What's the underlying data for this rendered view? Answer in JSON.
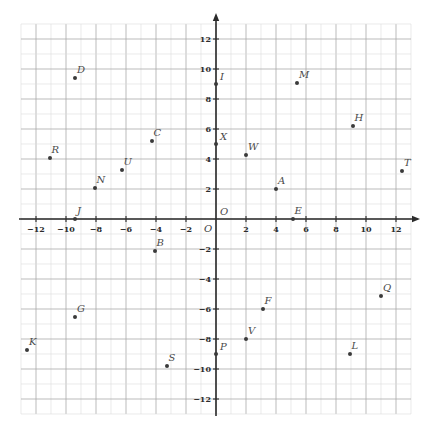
{
  "chart_data": {
    "type": "scatter",
    "title": "",
    "xlabel": "",
    "ylabel": "",
    "xlim": [
      -13,
      13
    ],
    "ylim": [
      -13,
      13
    ],
    "grid": true,
    "minor_grid_step": 1,
    "major_grid_step": 2,
    "legend": "none",
    "axis_origin_label": "O",
    "xticks": [
      -12,
      -10,
      -8,
      -6,
      -4,
      -2,
      2,
      4,
      6,
      8,
      10,
      12
    ],
    "xtick_labels": [
      "−12",
      "−10",
      "−8",
      "−6",
      "−4",
      "−2",
      "2",
      "4",
      "6",
      "8",
      "10",
      "12"
    ],
    "yticks": [
      12,
      10,
      8,
      6,
      4,
      2,
      -2,
      -4,
      -6,
      -8,
      -10,
      -12
    ],
    "ytick_labels": [
      "12",
      "10",
      "8",
      "6",
      "4",
      "2",
      "−2",
      "−4",
      "−6",
      "−8",
      "−10",
      "−12"
    ],
    "origin_tick_label": "O",
    "points": [
      {
        "label": "D",
        "x": -9.4,
        "y": 9.4
      },
      {
        "label": "I",
        "x": 0,
        "y": 9
      },
      {
        "label": "M",
        "x": 5.4,
        "y": 9.1
      },
      {
        "label": "H",
        "x": 9.1,
        "y": 6.2
      },
      {
        "label": "C",
        "x": -4.3,
        "y": 5.2
      },
      {
        "label": "X",
        "x": 0,
        "y": 5
      },
      {
        "label": "W",
        "x": 2,
        "y": 4.3
      },
      {
        "label": "R",
        "x": -11.1,
        "y": 4.1
      },
      {
        "label": "T",
        "x": 12.4,
        "y": 3.2
      },
      {
        "label": "U",
        "x": -6.3,
        "y": 3.3
      },
      {
        "label": "N",
        "x": -8.1,
        "y": 2.1
      },
      {
        "label": "A",
        "x": 4,
        "y": 2
      },
      {
        "label": "J",
        "x": -9.4,
        "y": 0
      },
      {
        "label": "O",
        "x": 0,
        "y": 0
      },
      {
        "label": "E",
        "x": 5.1,
        "y": 0
      },
      {
        "label": "B",
        "x": -4.1,
        "y": -2.1
      },
      {
        "label": "Q",
        "x": 11,
        "y": -5.1
      },
      {
        "label": "F",
        "x": 3.1,
        "y": -6
      },
      {
        "label": "G",
        "x": -9.4,
        "y": -6.5
      },
      {
        "label": "V",
        "x": 2,
        "y": -8
      },
      {
        "label": "K",
        "x": -12.6,
        "y": -8.7
      },
      {
        "label": "P",
        "x": 0,
        "y": -9
      },
      {
        "label": "L",
        "x": 8.9,
        "y": -9
      },
      {
        "label": "S",
        "x": -3.3,
        "y": -9.8
      }
    ],
    "colors": {
      "point": "#3a3a3a",
      "label": "#4a4a4a",
      "axis": "#2b2b2b",
      "major_grid": "#a9a9a9",
      "minor_grid": "#dcdcdc",
      "background": "#ffffff"
    }
  }
}
